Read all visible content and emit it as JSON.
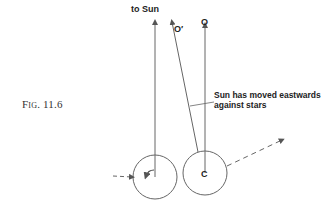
{
  "figure": {
    "label": "Fig. 11.6"
  },
  "labels": {
    "to_sun": "to Sun",
    "o_prime": "O′",
    "o": "O",
    "c": "C",
    "annotation_line1": "Sun has moved eastwards",
    "annotation_line2": "against stars"
  },
  "colors": {
    "line": "#555555",
    "text": "#222222"
  }
}
